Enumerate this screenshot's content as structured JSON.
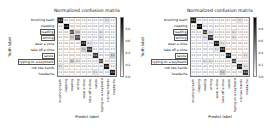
{
  "chart_data": [
    {
      "type": "heatmap",
      "title": "Normalized confusion matrix",
      "xlabel": "Predict label",
      "ylabel": "Truth label",
      "colormap": "Greys",
      "vmin": 0.0,
      "vmax": 1.0,
      "colorbar_ticks": [
        0.8,
        0.6,
        0.4,
        0.2,
        0.0
      ],
      "categories": [
        "brushing teeth",
        "clapping",
        "reading",
        "writing",
        "wear a shoe",
        "take off a shoe",
        "salute",
        "typing on a keyboard",
        "rub two hands",
        "headache"
      ],
      "highlighted_categories": [
        "reading",
        "writing",
        "salute",
        "typing on a keyboard"
      ],
      "matrix": [
        [
          0.9,
          0.0,
          0.0,
          0.0,
          0.0,
          0.0,
          0.0,
          0.0,
          0.1,
          0.0
        ],
        [
          0.0,
          1.0,
          0.0,
          0.0,
          0.0,
          0.0,
          0.0,
          0.0,
          0.0,
          0.0
        ],
        [
          0.0,
          0.0,
          0.7,
          0.2,
          0.0,
          0.0,
          0.0,
          0.1,
          0.0,
          0.0
        ],
        [
          0.0,
          0.0,
          0.2,
          0.7,
          0.0,
          0.0,
          0.0,
          0.1,
          0.0,
          0.0
        ],
        [
          0.0,
          0.0,
          0.0,
          0.0,
          0.9,
          0.1,
          0.0,
          0.0,
          0.0,
          0.0
        ],
        [
          0.0,
          0.0,
          0.0,
          0.0,
          0.2,
          0.8,
          0.0,
          0.0,
          0.0,
          0.0
        ],
        [
          0.0,
          0.0,
          0.0,
          0.0,
          0.0,
          0.0,
          0.8,
          0.0,
          0.0,
          0.2
        ],
        [
          0.0,
          0.0,
          0.2,
          0.1,
          0.0,
          0.0,
          0.0,
          0.7,
          0.0,
          0.0
        ],
        [
          0.1,
          0.0,
          0.0,
          0.0,
          0.0,
          0.0,
          0.0,
          0.0,
          0.9,
          0.0
        ],
        [
          0.0,
          0.0,
          0.0,
          0.0,
          0.0,
          0.0,
          0.1,
          0.0,
          0.0,
          0.9
        ]
      ]
    },
    {
      "type": "heatmap",
      "title": "Normalized confusion matrix",
      "xlabel": "Predict label",
      "ylabel": "Truth label",
      "colormap": "Greys",
      "vmin": 0.0,
      "vmax": 1.0,
      "colorbar_ticks": [
        0.8,
        0.6,
        0.4,
        0.2,
        0.0
      ],
      "categories": [
        "brushing teeth",
        "clapping",
        "reading",
        "writing",
        "wear a shoe",
        "take off a shoe",
        "salute",
        "typing on a keyboard",
        "rub two hands",
        "headache"
      ],
      "highlighted_categories": [
        "reading",
        "writing",
        "salute",
        "typing on a keyboard"
      ],
      "matrix": [
        [
          0.9,
          0.0,
          0.0,
          0.0,
          0.0,
          0.0,
          0.0,
          0.0,
          0.1,
          0.0
        ],
        [
          0.0,
          1.0,
          0.0,
          0.0,
          0.0,
          0.0,
          0.0,
          0.0,
          0.0,
          0.0
        ],
        [
          0.0,
          0.0,
          0.8,
          0.1,
          0.0,
          0.0,
          0.0,
          0.1,
          0.0,
          0.0
        ],
        [
          0.0,
          0.0,
          0.1,
          0.8,
          0.0,
          0.0,
          0.0,
          0.1,
          0.0,
          0.0
        ],
        [
          0.0,
          0.0,
          0.0,
          0.0,
          0.9,
          0.1,
          0.0,
          0.0,
          0.0,
          0.0
        ],
        [
          0.0,
          0.0,
          0.0,
          0.0,
          0.1,
          0.9,
          0.0,
          0.0,
          0.0,
          0.0
        ],
        [
          0.0,
          0.0,
          0.0,
          0.0,
          0.0,
          0.0,
          0.9,
          0.0,
          0.0,
          0.1
        ],
        [
          0.0,
          0.0,
          0.1,
          0.1,
          0.0,
          0.0,
          0.0,
          0.8,
          0.0,
          0.0
        ],
        [
          0.0,
          0.0,
          0.0,
          0.0,
          0.0,
          0.0,
          0.0,
          0.0,
          0.9,
          0.1
        ],
        [
          0.0,
          0.0,
          0.0,
          0.0,
          0.0,
          0.2,
          0.0,
          0.0,
          0.0,
          0.8
        ]
      ]
    }
  ]
}
